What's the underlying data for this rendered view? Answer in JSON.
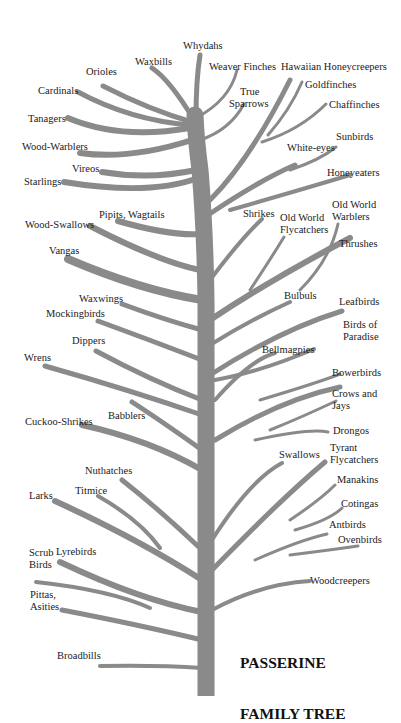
{
  "title": {
    "line1": "PASSERINE",
    "line2": "FAMILY TREE"
  },
  "colors": {
    "branch": "#8a8a8a",
    "text": "#1a1a1a",
    "background": "#ffffff"
  },
  "labels": {
    "whydahs": "Whydahs",
    "waxbills": "Waxbills",
    "weaver_finches": "Weaver Finches",
    "hawaiian_honeycreepers": "Hawaiian Honeycreepers",
    "orioles": "Orioles",
    "true_sparrows_1": "True",
    "true_sparrows_2": "Sparrows",
    "goldfinches": "Goldfinches",
    "cardinals": "Cardinals",
    "chaffinches": "Chaffinches",
    "tanagers": "Tanagers",
    "sunbirds": "Sunbirds",
    "wood_warblers": "Wood-Warblers",
    "white_eyes": "White-eyes",
    "vireos": "Vireos",
    "honeyeaters": "Honeyeaters",
    "starlings": "Starlings",
    "pipits_wagtails": "Pipits, Wagtails",
    "wood_swallows": "Wood-Swallows",
    "shrikes": "Shrikes",
    "old_world_flycatchers_1": "Old World",
    "old_world_flycatchers_2": "Flycatchers",
    "old_world_warblers_1": "Old World",
    "old_world_warblers_2": "Warblers",
    "vangas": "Vangas",
    "thrushes": "Thrushes",
    "waxwings": "Waxwings",
    "bulbuls": "Bulbuls",
    "leafbirds": "Leafbirds",
    "mockingbirds": "Mockingbirds",
    "birds_of_paradise_1": "Birds of",
    "birds_of_paradise_2": "Paradise",
    "dippers": "Dippers",
    "bellmagpies": "Bellmagpies",
    "wrens": "Wrens",
    "bowerbirds": "Bowerbirds",
    "crows_jays_1": "Crows and",
    "crows_jays_2": "Jays",
    "babblers": "Babblers",
    "cuckoo_shrikes": "Cuckoo-Shrikes",
    "drongos": "Drongos",
    "swallows": "Swallows",
    "tyrant_flycatchers_1": "Tyrant",
    "tyrant_flycatchers_2": "Flycatchers",
    "nuthatches": "Nuthatches",
    "manakins": "Manakins",
    "titmice": "Titmice",
    "larks": "Larks",
    "cotingas": "Cotingas",
    "antbirds": "Antbirds",
    "ovenbirds": "Ovenbirds",
    "scrub_birds_1": "Scrub",
    "scrub_birds_2": "Birds",
    "lyrebirds": "Lyrebirds",
    "woodcreepers": "Woodcreepers",
    "pittas_asities_1": "Pittas,",
    "pittas_asities_2": "Asities",
    "broadbills": "Broadbills"
  }
}
